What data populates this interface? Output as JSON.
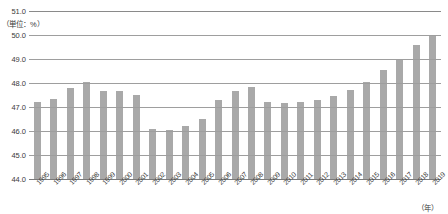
{
  "chart_data": {
    "type": "bar",
    "title": "",
    "subtitle": "",
    "unit_label": "（単位：%）",
    "xlabel": "（年）",
    "ylabel": "",
    "ylim": [
      44.0,
      51.0
    ],
    "ytick_step": 1.0,
    "ytick_labels": [
      "51.0",
      "50.0",
      "49.0",
      "48.0",
      "47.0",
      "46.0",
      "45.0",
      "44.0"
    ],
    "ytick_values": [
      51.0,
      50.0,
      49.0,
      48.0,
      47.0,
      46.0,
      45.0,
      44.0
    ],
    "grid": true,
    "legend": "none",
    "bar_color": "#a9a9a9",
    "axis_color": "#9e9e9e",
    "categories": [
      "1995",
      "1996",
      "1997",
      "1998",
      "1999",
      "2000",
      "2001",
      "2002",
      "2003",
      "2004",
      "2005",
      "2006",
      "2007",
      "2008",
      "2009",
      "2010",
      "2011",
      "2012",
      "2013",
      "2014",
      "2015",
      "2016",
      "2017",
      "2018",
      "2019"
    ],
    "values": [
      47.2,
      47.35,
      47.8,
      48.05,
      47.65,
      47.65,
      47.5,
      46.1,
      46.05,
      46.2,
      46.5,
      47.3,
      47.65,
      47.85,
      47.2,
      47.15,
      47.2,
      47.3,
      47.45,
      47.7,
      48.05,
      48.55,
      49.0,
      49.6,
      50.0
    ]
  }
}
